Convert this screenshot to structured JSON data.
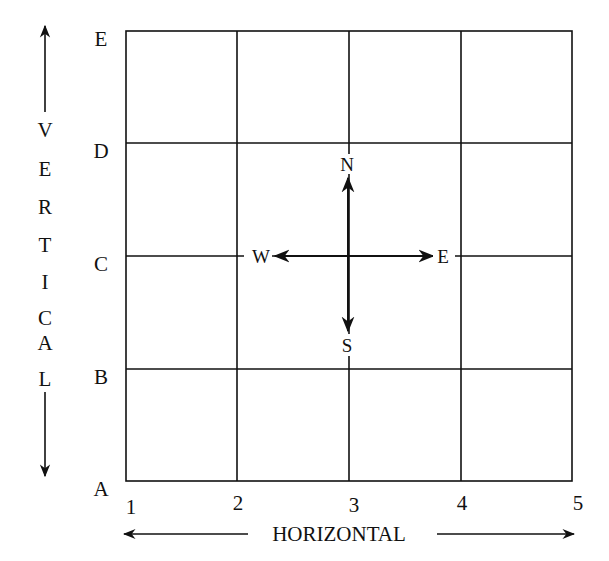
{
  "diagram": {
    "type": "coordinate-grid",
    "vertical_axis": {
      "title": "VERTICAL",
      "title_letters": [
        "V",
        "E",
        "R",
        "T",
        "I",
        "C",
        "A",
        "L"
      ],
      "labels": [
        "E",
        "D",
        "C",
        "B",
        "A"
      ]
    },
    "horizontal_axis": {
      "title": "HORIZONTAL",
      "labels": [
        "1",
        "2",
        "3",
        "4",
        "5"
      ]
    },
    "compass": {
      "north": "N",
      "south": "S",
      "west": "W",
      "east": "E"
    },
    "colors": {
      "line": "#111111",
      "background": "#ffffff"
    }
  }
}
